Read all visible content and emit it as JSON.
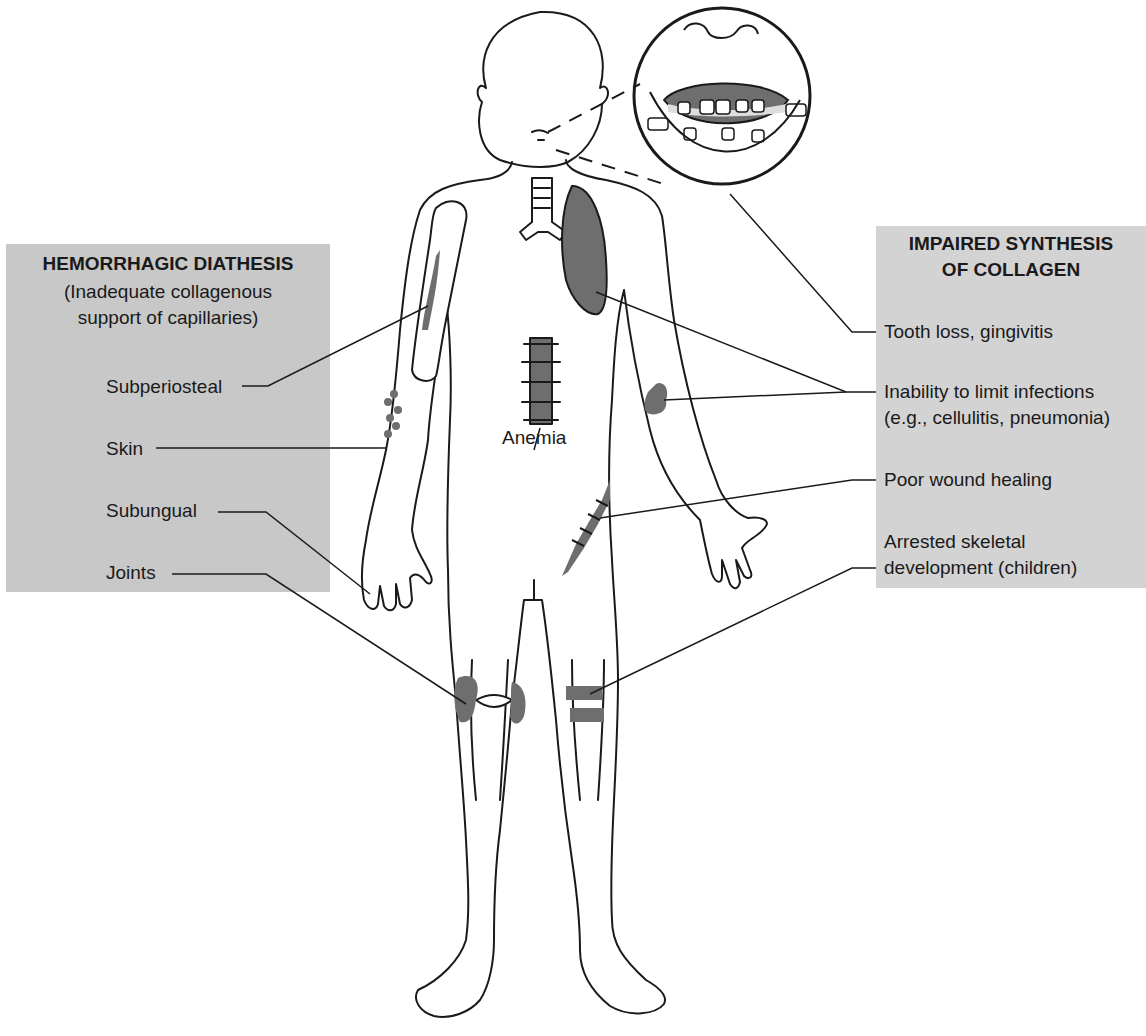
{
  "left_panel": {
    "title": "HEMORRHAGIC DIATHESIS",
    "subtitle_line1": "(Inadequate collagenous",
    "subtitle_line2": "support of capillaries)",
    "items": [
      {
        "label": "Subperiosteal"
      },
      {
        "label": "Skin"
      },
      {
        "label": "Subungual"
      },
      {
        "label": "Joints"
      }
    ]
  },
  "right_panel": {
    "title_line1": "IMPAIRED SYNTHESIS",
    "title_line2": "OF COLLAGEN",
    "items": [
      {
        "label": "Tooth loss, gingivitis"
      },
      {
        "label_line1": "Inability to limit infections",
        "label_line2": "(e.g., cellulitis, pneumonia)"
      },
      {
        "label": "Poor wound healing"
      },
      {
        "label_line1": "Arrested skeletal",
        "label_line2": "development (children)"
      }
    ]
  },
  "center": {
    "anemia_label": "Anemia"
  },
  "colors": {
    "left_panel_bg": "#c8c8c8",
    "right_panel_bg": "#d3d3d3",
    "lesion_fill": "#6e6e6e",
    "line": "#1a1a1a"
  }
}
